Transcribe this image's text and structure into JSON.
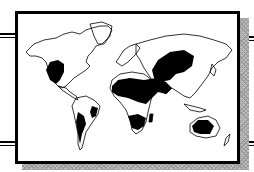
{
  "map": {
    "type": "world-map-illustration",
    "style": "black-and-white line art",
    "highlighted_regions": [
      "southwestern-north-america",
      "western-south-america-coast",
      "eastern-brazil",
      "patagonia",
      "sahara-and-north-africa",
      "arabian-peninsula",
      "central-asia",
      "southern-africa",
      "australia-interior"
    ],
    "colors": {
      "land_outline": "#000000",
      "highlight_fill": "#000000",
      "background": "#ffffff",
      "shadow": "#a8a8a8"
    }
  }
}
